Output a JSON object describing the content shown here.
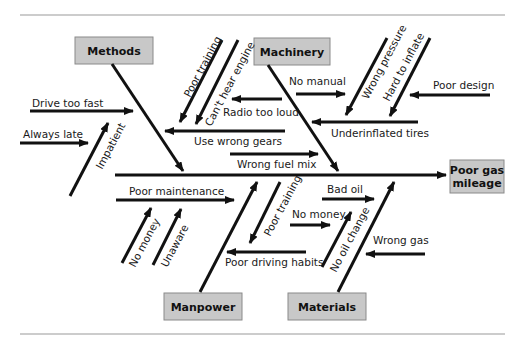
{
  "diagram": {
    "type": "fishbone",
    "title": "",
    "effect": {
      "line1": "Poor gas",
      "line2": "mileage"
    },
    "categories": {
      "methods": "Methods",
      "machinery": "Machinery",
      "manpower": "Manpower",
      "materials": "Materials"
    },
    "causes": {
      "drive_too_fast": "Drive too fast",
      "always_late": "Always late",
      "impatient": "Impatient",
      "poor_training_top": "Poor training",
      "cant_hear_engine": "Can't hear engine",
      "radio_too_loud": "Radio too loud",
      "use_wrong_gears": "Use wrong gears",
      "wrong_fuel_mix": "Wrong fuel mix",
      "no_manual": "No manual",
      "wrong_pressure": "Wrong pressure",
      "hard_to_inflate": "Hard to inflate",
      "poor_design": "Poor design",
      "underinflated_tires": "Underinflated tires",
      "poor_maintenance": "Poor maintenance",
      "no_money_left": "No money",
      "unaware": "Unaware",
      "poor_training_bottom": "Poor training",
      "poor_driving_habits": "Poor driving habits",
      "bad_oil": "Bad oil",
      "no_money_right": "No money",
      "no_oil_change": "No oil change",
      "wrong_gas": "Wrong gas"
    },
    "colors": {
      "box_fill": "#c8c8c8",
      "box_border": "#8a8a8a",
      "arrow": "#111111",
      "rule": "#999999"
    }
  }
}
